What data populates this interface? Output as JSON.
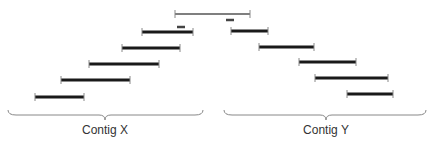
{
  "diagram": {
    "colors": {
      "read": "#1a1a1a",
      "tick": "#888888",
      "reference": "#555555",
      "marker": "#444444",
      "brace": "#888888",
      "text": "#333333"
    },
    "reference_bar": {
      "x1": 175,
      "x2": 250,
      "y": 14
    },
    "markers": [
      {
        "x1": 177,
        "x2": 185,
        "y": 27
      },
      {
        "x1": 226,
        "x2": 234,
        "y": 20
      }
    ],
    "contig_x_reads": [
      {
        "x1": 142,
        "x2": 193,
        "y": 32
      },
      {
        "x1": 122,
        "x2": 180,
        "y": 48
      },
      {
        "x1": 89,
        "x2": 159,
        "y": 64
      },
      {
        "x1": 61,
        "x2": 130,
        "y": 80
      },
      {
        "x1": 35,
        "x2": 84,
        "y": 97
      }
    ],
    "contig_y_reads": [
      {
        "x1": 231,
        "x2": 268,
        "y": 31
      },
      {
        "x1": 259,
        "x2": 314,
        "y": 47
      },
      {
        "x1": 299,
        "x2": 356,
        "y": 62
      },
      {
        "x1": 315,
        "x2": 388,
        "y": 78
      },
      {
        "x1": 347,
        "x2": 393,
        "y": 94
      }
    ],
    "braces": [
      {
        "x1": 8,
        "x2": 203,
        "mid": 105,
        "y": 110
      },
      {
        "x1": 224,
        "x2": 426,
        "mid": 326,
        "y": 110
      }
    ],
    "labels": {
      "contig_x": "Contig X",
      "contig_y": "Contig Y"
    }
  }
}
